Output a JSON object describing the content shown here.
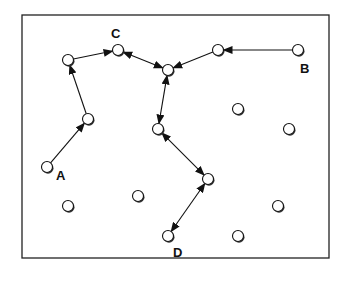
{
  "diagram": {
    "type": "network path diagram",
    "labels": {
      "A": "A",
      "B": "B",
      "C": "C",
      "D": "D"
    },
    "nodes": [
      {
        "id": "n1",
        "label": "A"
      },
      {
        "id": "n2",
        "label": ""
      },
      {
        "id": "n3",
        "label": ""
      },
      {
        "id": "n4",
        "label": "C"
      },
      {
        "id": "n5",
        "label": ""
      },
      {
        "id": "n6",
        "label": ""
      },
      {
        "id": "n7",
        "label": "B"
      },
      {
        "id": "n8",
        "label": ""
      },
      {
        "id": "n9",
        "label": ""
      },
      {
        "id": "n10",
        "label": ""
      },
      {
        "id": "n11",
        "label": "D"
      },
      {
        "id": "n12",
        "label": ""
      },
      {
        "id": "n13",
        "label": ""
      },
      {
        "id": "n14",
        "label": ""
      },
      {
        "id": "n15",
        "label": ""
      },
      {
        "id": "n16",
        "label": ""
      }
    ],
    "edges": [
      {
        "from": "n1",
        "to": "n2",
        "direction": "forward"
      },
      {
        "from": "n2",
        "to": "n3",
        "direction": "forward"
      },
      {
        "from": "n3",
        "to": "n4",
        "direction": "forward"
      },
      {
        "from": "n4",
        "to": "n5",
        "direction": "both"
      },
      {
        "from": "n7",
        "to": "n6",
        "direction": "forward"
      },
      {
        "from": "n6",
        "to": "n5",
        "direction": "forward"
      },
      {
        "from": "n5",
        "to": "n8",
        "direction": "both"
      },
      {
        "from": "n8",
        "to": "n9",
        "direction": "both"
      },
      {
        "from": "n9",
        "to": "n11",
        "direction": "both"
      }
    ]
  }
}
